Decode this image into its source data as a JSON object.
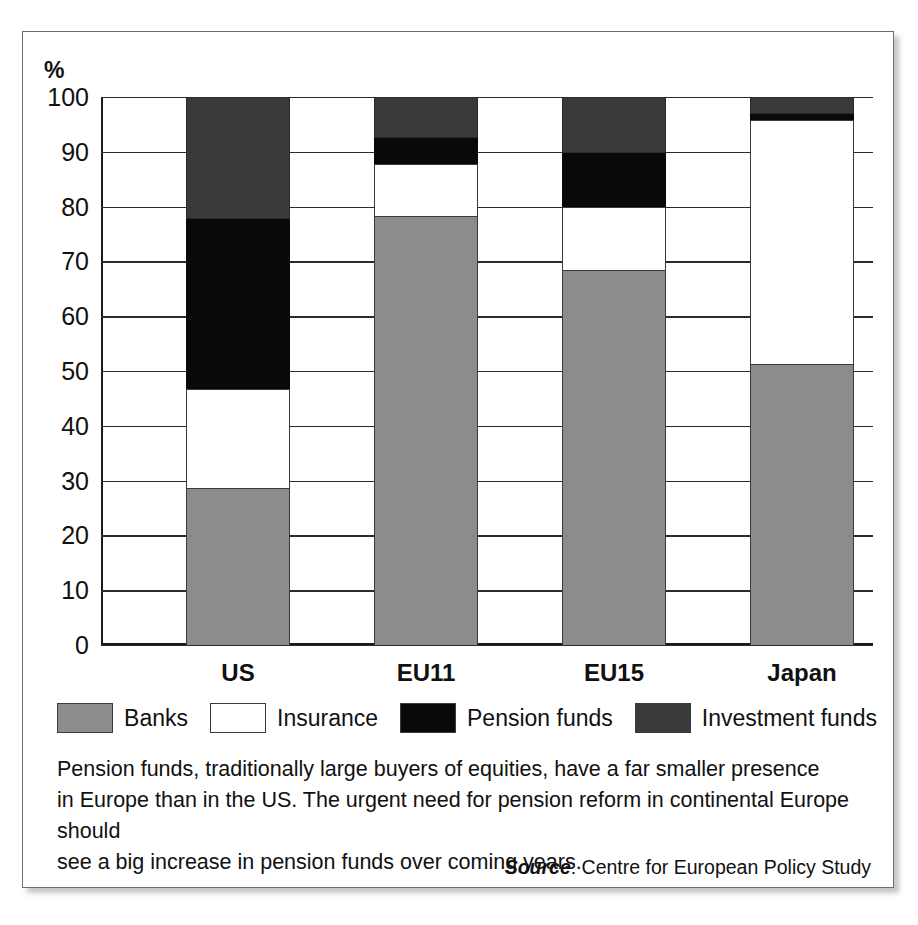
{
  "axis": {
    "unit_symbol": "%",
    "y_ticks": [
      "100",
      "90",
      "80",
      "70",
      "60",
      "50",
      "40",
      "30",
      "20",
      "10",
      "0"
    ]
  },
  "legend": {
    "items": [
      {
        "label": "Banks",
        "color": "#8c8c8c"
      },
      {
        "label": "Insurance",
        "color": "#ffffff"
      },
      {
        "label": "Pension funds",
        "color": "#090909"
      },
      {
        "label": "Investment funds",
        "color": "#3a3a3a"
      }
    ]
  },
  "caption": {
    "line1": "Pension funds, traditionally large buyers of equities, have a far smaller presence",
    "line2": "in Europe than in the US. The urgent need for pension reform in continental Europe should",
    "line3": "see a big increase in pension funds over coming years."
  },
  "source": {
    "label": "Source",
    "separator": ": ",
    "value": "Centre for European Policy Study"
  },
  "chart_data": {
    "type": "bar",
    "title": "",
    "xlabel": "",
    "ylabel": "%",
    "ylim": [
      0,
      100
    ],
    "grid": true,
    "stacked": true,
    "legend_position": "bottom",
    "categories": [
      "US",
      "EU11",
      "EU15",
      "Japan"
    ],
    "series": [
      {
        "name": "Banks",
        "color": "#8c8c8c",
        "values": [
          28.6,
          78.2,
          68.5,
          51.3
        ]
      },
      {
        "name": "Insurance",
        "color": "#ffffff",
        "values": [
          18.2,
          9.6,
          11.5,
          44.5
        ]
      },
      {
        "name": "Pension funds",
        "color": "#090909",
        "values": [
          30.9,
          4.7,
          9.8,
          1.1
        ]
      },
      {
        "name": "Investment funds",
        "color": "#3a3a3a",
        "values": [
          22.3,
          7.5,
          10.2,
          3.1
        ]
      }
    ],
    "cumulative_tops": {
      "US": [
        28.6,
        46.8,
        77.7,
        100
      ],
      "EU11": [
        78.2,
        87.8,
        92.5,
        100
      ],
      "EU15": [
        68.5,
        80.0,
        89.8,
        100
      ],
      "Japan": [
        51.3,
        95.8,
        96.9,
        100
      ]
    }
  }
}
